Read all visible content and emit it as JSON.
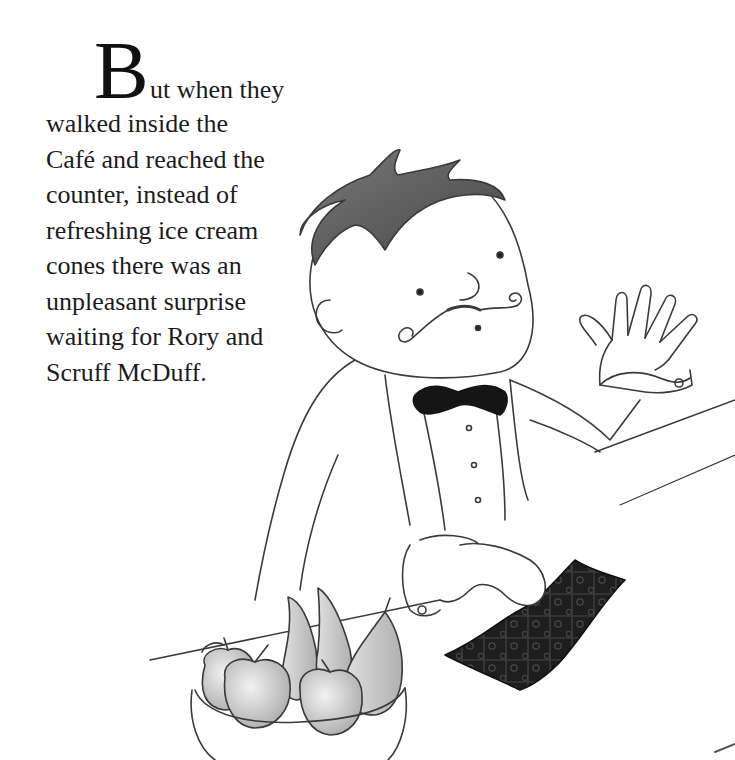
{
  "story": {
    "drop_cap": "B",
    "first_line_rest": "ut when they",
    "lines": [
      "walked inside the",
      "Café and reached the",
      "counter, instead of",
      "refreshing ice cream",
      "cones there was an",
      "unpleasant surprise",
      "waiting for Rory and",
      "Scruff McDuff."
    ]
  },
  "illustration": {
    "subject": "café waiter with curly moustache and bow tie behind counter, wiping with dark polka-dot cloth, bowl of fruit (apples, bananas, pear) in foreground",
    "palette": {
      "ink": "#3a3a3a",
      "hair": "#5a5a5a",
      "bowtie": "#151515",
      "cloth": "#1e1e1e",
      "fruit_shade": "#bdbdbd"
    }
  }
}
